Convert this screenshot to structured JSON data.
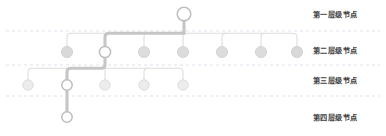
{
  "diagram": {
    "type": "hierarchy-tree",
    "title": "",
    "canvas": {
      "width": 386,
      "height": 136,
      "background": "#ffffff"
    },
    "colors": {
      "node_fill_plain": "#d9d9d9",
      "node_fill_highlight": "#ffffff",
      "node_stroke": "#b0b0b0",
      "node_stroke_highlight": "#9e9e9e",
      "link_plain": "#d8d8d8",
      "link_highlight": "#c3c3c3",
      "band_divider": "#cfd8e4",
      "label_text": "#3f3f3f"
    },
    "band_dividers_y": [
      31,
      65,
      96
    ],
    "labels": [
      {
        "id": "level-1",
        "text": "第一层级节点",
        "x": 313,
        "y": 15
      },
      {
        "id": "level-2",
        "text": "第二层级节点",
        "x": 313,
        "y": 51
      },
      {
        "id": "level-3",
        "text": "第三层级节点",
        "x": 313,
        "y": 81
      },
      {
        "id": "level-4",
        "text": "第四层级节点",
        "x": 313,
        "y": 118
      }
    ],
    "nodes": [
      {
        "id": "n1-root",
        "level": 1,
        "x": 184,
        "y": 14,
        "r": 6.8,
        "highlight": true,
        "on_path": true
      },
      {
        "id": "n2-a",
        "level": 2,
        "x": 67,
        "y": 52,
        "r": 5.6,
        "highlight": false,
        "on_path": false
      },
      {
        "id": "n2-b",
        "level": 2,
        "x": 105,
        "y": 52,
        "r": 5.6,
        "highlight": true,
        "on_path": true
      },
      {
        "id": "n2-c",
        "level": 2,
        "x": 144,
        "y": 52,
        "r": 5.6,
        "highlight": false,
        "on_path": false
      },
      {
        "id": "n2-d",
        "level": 2,
        "x": 183,
        "y": 52,
        "r": 5.6,
        "highlight": false,
        "on_path": false
      },
      {
        "id": "n2-e",
        "level": 2,
        "x": 222,
        "y": 52,
        "r": 5.6,
        "highlight": false,
        "on_path": false
      },
      {
        "id": "n2-f",
        "level": 2,
        "x": 261,
        "y": 52,
        "r": 5.6,
        "highlight": false,
        "on_path": false
      },
      {
        "id": "n2-g",
        "level": 2,
        "x": 297,
        "y": 52,
        "r": 5.6,
        "highlight": false,
        "on_path": false
      },
      {
        "id": "n3-a",
        "level": 3,
        "x": 28,
        "y": 85,
        "r": 5.2,
        "highlight": false,
        "on_path": false
      },
      {
        "id": "n3-b",
        "level": 3,
        "x": 67,
        "y": 85,
        "r": 5.2,
        "highlight": true,
        "on_path": true
      },
      {
        "id": "n3-c",
        "level": 3,
        "x": 105,
        "y": 85,
        "r": 5.2,
        "highlight": false,
        "on_path": false
      },
      {
        "id": "n3-d",
        "level": 3,
        "x": 144,
        "y": 85,
        "r": 5.2,
        "highlight": false,
        "on_path": false
      },
      {
        "id": "n3-e",
        "level": 3,
        "x": 183,
        "y": 85,
        "r": 5.2,
        "highlight": false,
        "on_path": false
      },
      {
        "id": "n4-a",
        "level": 4,
        "x": 67,
        "y": 117,
        "r": 5.2,
        "highlight": true,
        "on_path": true
      }
    ],
    "links": [
      {
        "id": "l-root-bus",
        "from": "n1-root",
        "to": "bus-2",
        "d": "M184,20.8 L184,33 L184,33",
        "highlight": true
      },
      {
        "id": "l-bus2",
        "from": "bus-2",
        "to": "bus-2",
        "d": "M105,38 L105,33 Q105,33 109,33 L297,33",
        "highlight": false
      },
      {
        "id": "l-bus2-hi",
        "from": "bus-2",
        "to": "bus-2",
        "d": "M105,33 L184,33",
        "highlight": true
      },
      {
        "id": "l-n2a",
        "from": "bus-2",
        "to": "n2-a",
        "d": "M67,46.4 L67,37 Q67,33 71,33 L105,33",
        "highlight": false
      },
      {
        "id": "l-n2b",
        "from": "bus-2",
        "to": "n2-b",
        "d": "M105,46.4 L105,33",
        "highlight": true
      },
      {
        "id": "l-n2c",
        "from": "bus-2",
        "to": "n2-c",
        "d": "M144,46.4 L144,37 Q144,33 144,33",
        "highlight": false
      },
      {
        "id": "l-n2d",
        "from": "bus-2",
        "to": "n2-d",
        "d": "M183,46.4 L183,33",
        "highlight": false
      },
      {
        "id": "l-n2e",
        "from": "bus-2",
        "to": "n2-e",
        "d": "M222,46.4 L222,37 Q222,33 222,33",
        "highlight": false
      },
      {
        "id": "l-n2f",
        "from": "bus-2",
        "to": "n2-f",
        "d": "M261,46.4 L261,37 Q261,33 261,33",
        "highlight": false
      },
      {
        "id": "l-n2g",
        "from": "bus-2",
        "to": "n2-g",
        "d": "M297,46.4 L297,37 Q297,33 297,33",
        "highlight": false
      },
      {
        "id": "l-n2b-down",
        "from": "n2-b",
        "to": "bus-3",
        "d": "M105,57.6 L105,68",
        "highlight": true
      },
      {
        "id": "l-bus3",
        "from": "bus-3",
        "to": "bus-3",
        "d": "M28,68 L183,68",
        "highlight": false
      },
      {
        "id": "l-bus3-hi",
        "from": "bus-3",
        "to": "bus-3",
        "d": "M67,68 L105,68",
        "highlight": true
      },
      {
        "id": "l-n3a",
        "from": "bus-3",
        "to": "n3-a",
        "d": "M28,79.8 L28,72 Q28,68 32,68 L67,68",
        "highlight": false
      },
      {
        "id": "l-n3b",
        "from": "bus-3",
        "to": "n3-b",
        "d": "M67,79.8 L67,68",
        "highlight": true
      },
      {
        "id": "l-n3c",
        "from": "bus-3",
        "to": "n3-c",
        "d": "M105,79.8 L105,68",
        "highlight": false
      },
      {
        "id": "l-n3d",
        "from": "bus-3",
        "to": "n3-d",
        "d": "M144,79.8 L144,72 Q144,68 144,68",
        "highlight": false
      },
      {
        "id": "l-n3e",
        "from": "bus-3",
        "to": "n3-e",
        "d": "M183,79.8 L183,72 Q183,68 183,68",
        "highlight": false
      },
      {
        "id": "l-n4a",
        "from": "n3-b",
        "to": "n4-a",
        "d": "M67,90.2 L67,111.8",
        "highlight": true
      }
    ]
  }
}
